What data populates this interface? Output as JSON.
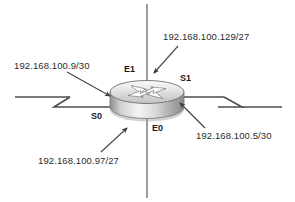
{
  "diagram": {
    "type": "network-topology",
    "device": {
      "name": "router",
      "icon": "cisco-router-icon",
      "shape": "cylinder"
    },
    "interfaces": [
      {
        "id": "e1",
        "label": "E1",
        "position": "top",
        "kind": "ethernet"
      },
      {
        "id": "s1",
        "label": "S1",
        "position": "right",
        "kind": "serial"
      },
      {
        "id": "e0",
        "label": "E0",
        "position": "bottom",
        "kind": "ethernet"
      },
      {
        "id": "s0",
        "label": "S0",
        "position": "left",
        "kind": "serial"
      }
    ],
    "annotations": [
      {
        "id": "ip-left",
        "text": "192.168.100.9/30",
        "points_to": "s0"
      },
      {
        "id": "ip-top",
        "text": "192.168.100.129/27",
        "points_to": "e1"
      },
      {
        "id": "ip-right",
        "text": "192.168.100.5/30",
        "points_to": "s1"
      },
      {
        "id": "ip-bottom",
        "text": "192.168.100.97/27",
        "points_to": "e0"
      }
    ],
    "links": [
      {
        "id": "serial-link-left",
        "kind": "serial",
        "break": "zigzag"
      },
      {
        "id": "serial-link-right",
        "kind": "serial",
        "break": "zigzag"
      },
      {
        "id": "ethernet-link-top",
        "kind": "ethernet",
        "break": "none"
      },
      {
        "id": "ethernet-link-bottom",
        "kind": "ethernet",
        "break": "none"
      }
    ],
    "colors": {
      "line": "#555555",
      "text": "#2b2b2b",
      "router_light": "#f2f2f2",
      "router_mid": "#bdbdbd",
      "router_dark": "#8a8a8a"
    }
  }
}
